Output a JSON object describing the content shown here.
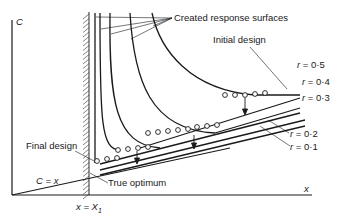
{
  "diagram": {
    "axes": {
      "y_label": "C",
      "x_label": "x"
    },
    "constraint": {
      "label": "x = X",
      "subscript": "1"
    },
    "objective_line_label": "C = x",
    "annotations": {
      "created_response_surfaces": "Created response surfaces",
      "initial_design": "Initial design",
      "final_design": "Final design",
      "true_optimum": "True optimum"
    },
    "r_levels": [
      {
        "label": "r = 0·5",
        "value": 0.5
      },
      {
        "label": "r = 0·4",
        "value": 0.4
      },
      {
        "label": "r = 0·3",
        "value": 0.3
      },
      {
        "label": "r = 0·2",
        "value": 0.2
      },
      {
        "label": "r = 0·1",
        "value": 0.1
      }
    ],
    "colors": {
      "ink": "#1a1a1a",
      "background": "#ffffff"
    }
  }
}
